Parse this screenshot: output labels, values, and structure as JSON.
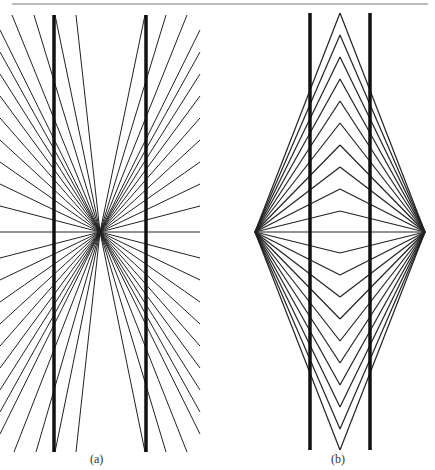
{
  "figure": {
    "top_rule": {
      "x1": 12,
      "x2": 428,
      "y": 4,
      "color": "#777777"
    },
    "panels": [
      {
        "id": "a",
        "caption": "(a)",
        "name": "Hering illusion",
        "center": [
          100,
          232
        ],
        "thick_lines": [
          {
            "x": 54,
            "y1": 15,
            "y2": 452
          },
          {
            "x": 146,
            "y1": 15,
            "y2": 452
          }
        ],
        "ray_top_x": [
          12,
          34,
          55,
          76,
          145,
          166,
          187
        ],
        "ray_bottom_x": [
          14,
          36,
          55,
          76,
          145,
          166,
          187
        ],
        "ray_left_y": [
          30,
          52,
          74,
          96,
          118,
          140,
          162,
          184,
          206,
          232,
          258,
          280,
          302,
          324,
          346,
          368,
          390,
          412,
          434
        ],
        "ray_right_y": [
          30,
          52,
          74,
          96,
          118,
          140,
          162,
          184,
          206,
          232,
          258,
          280,
          302,
          324,
          346,
          368,
          390,
          412,
          434
        ],
        "left_x": 0,
        "right_x": 200,
        "top_y": 15,
        "bottom_y": 452
      },
      {
        "id": "b",
        "caption": "(b)",
        "name": "Wundt illusion",
        "left_vertex": [
          255,
          232
        ],
        "right_vertex": [
          425,
          232
        ],
        "apex_x": 340,
        "thick_lines": [
          {
            "x": 310,
            "y1": 13,
            "y2": 450
          },
          {
            "x": 370,
            "y1": 13,
            "y2": 450
          }
        ],
        "apex_top_y": [
          13,
          35,
          57,
          79,
          101,
          123,
          145,
          167,
          189,
          211
        ],
        "apex_bottom_y": [
          253,
          275,
          297,
          319,
          341,
          363,
          385,
          407,
          429,
          450
        ],
        "middle_line": true
      }
    ]
  }
}
